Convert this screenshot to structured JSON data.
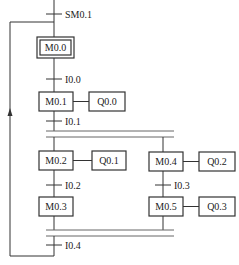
{
  "diagram": {
    "type": "sequential-function-chart",
    "initial_transition": "SM0.1",
    "steps": [
      {
        "id": "M0.0",
        "initial": true,
        "action": null
      },
      {
        "id": "M0.1",
        "action": "Q0.0"
      },
      {
        "id": "M0.2",
        "action": "Q0.1"
      },
      {
        "id": "M0.3",
        "action": null
      },
      {
        "id": "M0.4",
        "action": "Q0.2"
      },
      {
        "id": "M0.5",
        "action": "Q0.3"
      }
    ],
    "transitions": [
      {
        "label": "SM0.1"
      },
      {
        "label": "I0.0"
      },
      {
        "label": "I0.1"
      },
      {
        "label": "I0.2"
      },
      {
        "label": "I0.3"
      },
      {
        "label": "I0.4"
      }
    ],
    "colors": {
      "line": "#333333",
      "background": "#ffffff"
    }
  }
}
